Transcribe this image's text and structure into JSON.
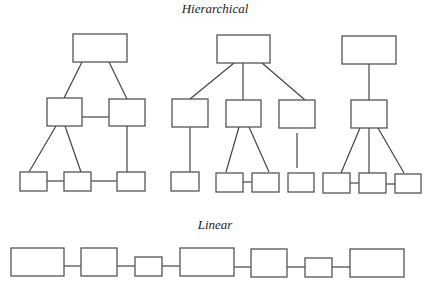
{
  "diagram": {
    "sections": [
      {
        "id": "hierarchical",
        "title": "Hierarchical",
        "trees": [
          {
            "name": "tree-1",
            "nodes": [
              "a",
              "b",
              "c",
              "d",
              "e",
              "f"
            ],
            "edges": [
              [
                "a",
                "b"
              ],
              [
                "a",
                "c"
              ],
              [
                "b",
                "c"
              ],
              [
                "b",
                "d"
              ],
              [
                "b",
                "e"
              ],
              [
                "d",
                "e"
              ],
              [
                "e",
                "f"
              ],
              [
                "c",
                "f"
              ]
            ]
          },
          {
            "name": "tree-2",
            "nodes": [
              "a",
              "b",
              "c",
              "d",
              "e",
              "f",
              "g",
              "h"
            ],
            "edges": [
              [
                "a",
                "b"
              ],
              [
                "a",
                "c"
              ],
              [
                "a",
                "d"
              ],
              [
                "b",
                "e"
              ],
              [
                "c",
                "f"
              ],
              [
                "c",
                "g"
              ],
              [
                "f",
                "g"
              ],
              [
                "d",
                "h (disconnected stub)"
              ]
            ]
          },
          {
            "name": "tree-3",
            "nodes": [
              "a",
              "b",
              "c",
              "d",
              "e"
            ],
            "edges": [
              [
                "a",
                "b"
              ],
              [
                "b",
                "c"
              ],
              [
                "b",
                "d"
              ],
              [
                "b",
                "e"
              ],
              [
                "c",
                "d"
              ],
              [
                "d",
                "e"
              ]
            ]
          }
        ]
      },
      {
        "id": "linear",
        "title": "Linear",
        "nodes": [
          "n1",
          "n2",
          "n3",
          "n4",
          "n5",
          "n6",
          "n7"
        ],
        "edges": [
          [
            "n1",
            "n2"
          ],
          [
            "n2",
            "n3"
          ],
          [
            "n3",
            "n4"
          ],
          [
            "n4",
            "n5"
          ],
          [
            "n5",
            "n6"
          ],
          [
            "n6",
            "n7"
          ]
        ]
      }
    ]
  }
}
